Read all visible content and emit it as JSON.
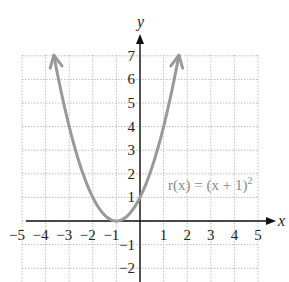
{
  "chart_data": {
    "type": "line",
    "title": "",
    "function_label": "r(x) = (x + 1)²",
    "xlabel": "x",
    "ylabel": "y",
    "xlim": [
      -5,
      5
    ],
    "ylim": [
      -2,
      7
    ],
    "grid": true,
    "x_ticks": [
      "-5",
      "-4",
      "-3",
      "-2",
      "-1",
      "1",
      "2",
      "3",
      "4",
      "5"
    ],
    "y_ticks": [
      "-2",
      "-1",
      "1",
      "2",
      "3",
      "4",
      "5",
      "6",
      "7"
    ],
    "series": [
      {
        "name": "r(x) = (x + 1)²",
        "color": "#999999",
        "x": [
          -3.65,
          -3,
          -2,
          -1,
          0,
          1,
          1.65
        ],
        "y": [
          7,
          4,
          1,
          0,
          1,
          4,
          7
        ],
        "arrows": "both-ends"
      }
    ],
    "vertex": [
      -1,
      0
    ]
  },
  "labels": {
    "x_axis": "x",
    "y_axis": "y",
    "function": "r(x) = (x + 1)",
    "exponent": "2"
  },
  "colors": {
    "curve": "#999999",
    "grid": "#bdbdbd",
    "axis": "#111111",
    "label": "#8a8a8a"
  }
}
